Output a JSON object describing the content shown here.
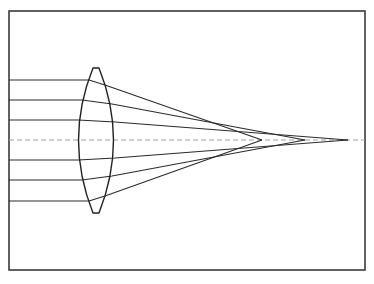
{
  "diagram": {
    "type": "ray-optics",
    "canvas": {
      "width": 374,
      "height": 284
    },
    "colors": {
      "background": "#ffffff",
      "frame": "#3a3a3a",
      "lens": "#222222",
      "rays": "#2a2a2a",
      "optical_axis": "#a0a0a0"
    },
    "frame": {
      "x": 9,
      "y": 11,
      "width": 356,
      "height": 259
    },
    "optical_axis": {
      "y": 140,
      "x_start": 9,
      "x_end": 365,
      "style": "dashed"
    },
    "lens": {
      "shape": "biconvex",
      "center_x": 96,
      "top_flat": {
        "x1": 93,
        "x2": 99,
        "y": 68
      },
      "bottom_flat": {
        "x1": 93,
        "x2": 99,
        "y": 213
      },
      "left_bulge_x": 76,
      "right_bulge_x": 116
    },
    "rays": [
      {
        "id": "ray-1",
        "entry_y": 80,
        "points": [
          [
            9,
            80
          ],
          [
            89,
            80
          ],
          [
            105,
            85
          ],
          [
            262,
            140
          ]
        ]
      },
      {
        "id": "ray-2",
        "entry_y": 100,
        "points": [
          [
            9,
            100
          ],
          [
            82,
            100
          ],
          [
            112,
            104
          ],
          [
            305,
            140
          ]
        ]
      },
      {
        "id": "ray-3",
        "entry_y": 120,
        "points": [
          [
            9,
            120
          ],
          [
            78,
            120
          ],
          [
            115,
            122
          ],
          [
            348,
            140
          ]
        ]
      },
      {
        "id": "ray-4",
        "entry_y": 160,
        "points": [
          [
            9,
            160
          ],
          [
            78,
            160
          ],
          [
            115,
            158
          ],
          [
            348,
            140
          ]
        ]
      },
      {
        "id": "ray-5",
        "entry_y": 180,
        "points": [
          [
            9,
            180
          ],
          [
            82,
            180
          ],
          [
            112,
            176
          ],
          [
            305,
            140
          ]
        ]
      },
      {
        "id": "ray-6",
        "entry_y": 201,
        "points": [
          [
            9,
            201
          ],
          [
            89,
            201
          ],
          [
            105,
            196
          ],
          [
            262,
            140
          ]
        ]
      }
    ],
    "focal_points": [
      {
        "label": "marginal",
        "x": 262,
        "y": 140
      },
      {
        "label": "intermediate",
        "x": 305,
        "y": 140
      },
      {
        "label": "paraxial",
        "x": 348,
        "y": 140
      }
    ]
  }
}
